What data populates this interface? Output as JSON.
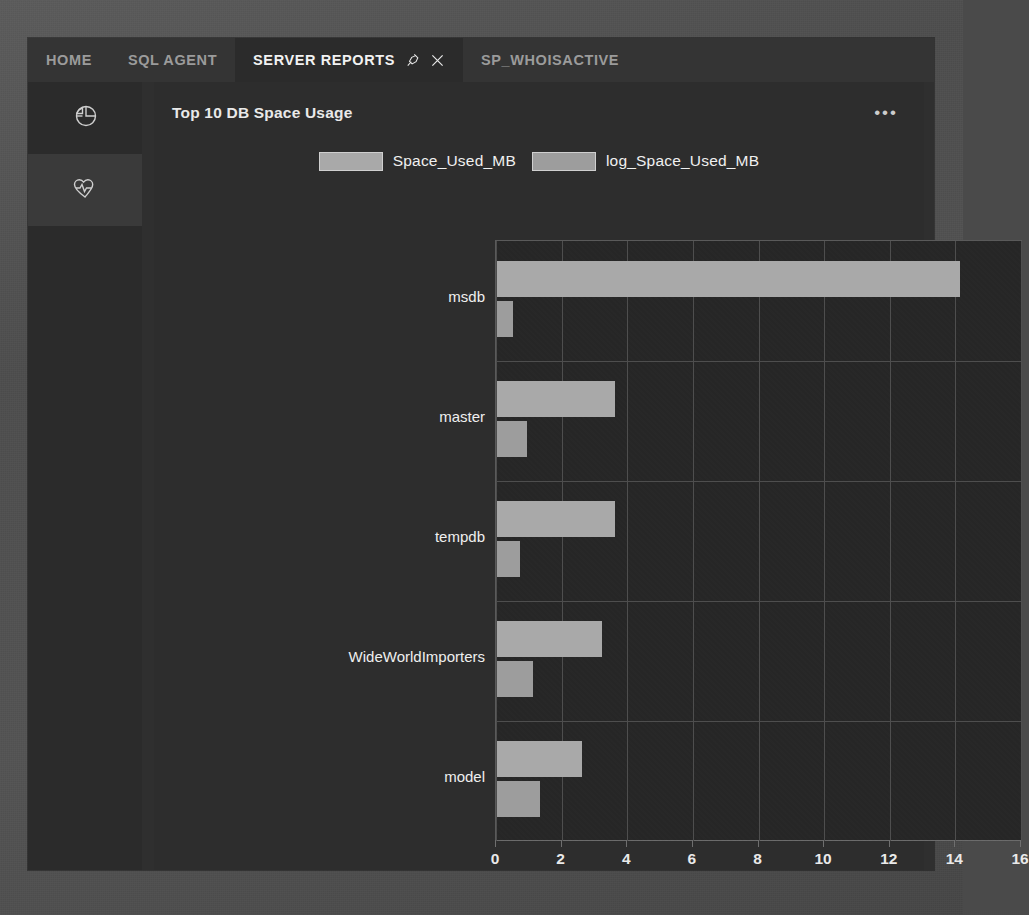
{
  "tabs": [
    {
      "label": "HOME",
      "active": false
    },
    {
      "label": "SQL AGENT",
      "active": false
    },
    {
      "label": "SERVER REPORTS",
      "active": true,
      "icons": [
        "pin-icon",
        "close-icon"
      ]
    },
    {
      "label": "SP_WHOISACTIVE",
      "active": false
    }
  ],
  "sidebar": {
    "items": [
      {
        "icon": "pie-chart-icon",
        "selected": false
      },
      {
        "icon": "heart-pulse-icon",
        "selected": true
      }
    ]
  },
  "card": {
    "title": "Top 10 DB Space Usage",
    "menu_label": "•••",
    "menu_icon": "more-options-icon"
  },
  "background_text": [
    {
      "text": "mid-cities",
      "x": 706,
      "y": 862
    }
  ],
  "colors": {
    "window_bg": "#2b2b2b",
    "card_bg": "#2d2d2d",
    "plot_bg": "#262626",
    "grid": "#4e4e4e",
    "series_space_used": "#a9a9a9",
    "series_log_space_used": "#9d9d9d",
    "text": "#efefef",
    "tab_inactive_text": "#9b9b9b"
  },
  "chart_data": {
    "type": "bar",
    "orientation": "horizontal",
    "title": "Top 10 DB Space Usage",
    "categories": [
      "msdb",
      "master",
      "tempdb",
      "WideWorldImporters",
      "model"
    ],
    "series": [
      {
        "name": "Space_Used_MB",
        "values": [
          14.1,
          3.6,
          3.6,
          3.2,
          2.6
        ],
        "color": "#a9a9a9"
      },
      {
        "name": "log_Space_Used_MB",
        "values": [
          0.5,
          0.9,
          0.7,
          1.1,
          1.3
        ],
        "color": "#9d9d9d"
      }
    ],
    "xlabel": "",
    "ylabel": "",
    "xlim": [
      0,
      16
    ],
    "xticks": [
      0,
      2,
      4,
      6,
      8,
      10,
      12,
      14,
      16
    ],
    "xtick_labels": [
      "0",
      "2",
      "4",
      "6",
      "8",
      "10",
      "12",
      "14",
      "16"
    ],
    "grid": true,
    "legend_position": "top"
  }
}
